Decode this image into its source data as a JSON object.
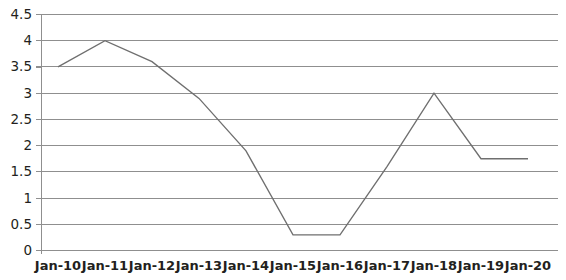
{
  "chart_data": {
    "type": "line",
    "title": "",
    "subtitle": "",
    "xlabel": "",
    "ylabel": "",
    "categories": [
      "Jan-10",
      "Jan-11",
      "Jan-12",
      "Jan-13",
      "Jan-14",
      "Jan-15",
      "Jan-16",
      "Jan-17",
      "Jan-18",
      "Jan-19",
      "Jan-20"
    ],
    "values": [
      3.5,
      4,
      3.6,
      2.9,
      1.9,
      0.3,
      0.3,
      1.6,
      3,
      1.75,
      1.75
    ],
    "series": [
      {
        "name": "",
        "values": [
          3.5,
          4,
          3.6,
          2.9,
          1.9,
          0.3,
          0.3,
          1.6,
          3,
          1.75,
          1.75
        ]
      }
    ],
    "ylim": [
      0,
      4.5
    ],
    "ytick_labels": [
      "0",
      "0.5",
      "1",
      "1.5",
      "2",
      "2.5",
      "3",
      "3.5",
      "4",
      "4.5"
    ],
    "ytick_values": [
      0,
      0.5,
      1,
      1.5,
      2,
      2.5,
      3,
      3.5,
      4,
      4.5
    ],
    "xtick_labels": [
      "Jan-10",
      "Jan-11",
      "Jan-12",
      "Jan-13",
      "Jan-14",
      "Jan-15",
      "Jan-16",
      "Jan-17",
      "Jan-18",
      "Jan-19",
      "Jan-20"
    ],
    "grid": true,
    "grid_axis": "y",
    "legend": false,
    "legend_position": "none",
    "annotations": [],
    "colors": {
      "line": "#6f6f6f",
      "grid": "#8f8f8f",
      "axis": "#8f8f8f",
      "label": "#231f20",
      "background": "#ffffff"
    }
  }
}
